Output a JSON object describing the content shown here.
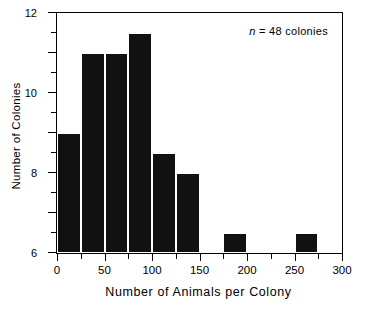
{
  "chart_data": {
    "type": "bar",
    "title": "",
    "subtitle": "",
    "xlabel": "Number of Animals per Colony",
    "ylabel": "Number of Colonies",
    "xlim": [
      0,
      300
    ],
    "ylim": [
      0,
      12
    ],
    "grid": false,
    "legend": null,
    "bin_width": 25,
    "categories": [
      "0-25",
      "25-50",
      "50-75",
      "75-100",
      "100-125",
      "125-150",
      "150-175",
      "175-200",
      "200-225",
      "225-250",
      "250-275",
      "275-300"
    ],
    "bin_starts": [
      0,
      25,
      50,
      75,
      100,
      125,
      150,
      175,
      200,
      225,
      250,
      275
    ],
    "values": [
      6,
      10,
      10,
      11,
      5,
      4,
      0,
      1,
      0,
      0,
      1,
      0
    ],
    "bars": [
      {
        "start": 0,
        "end": 25,
        "value": 6
      },
      {
        "start": 25,
        "end": 50,
        "value": 10
      },
      {
        "start": 50,
        "end": 75,
        "value": 10
      },
      {
        "start": 75,
        "end": 100,
        "value": 11
      },
      {
        "start": 100,
        "end": 125,
        "value": 5
      },
      {
        "start": 125,
        "end": 150,
        "value": 4
      },
      {
        "start": 175,
        "end": 200,
        "value": 1
      },
      {
        "start": 250,
        "end": 275,
        "value": 1
      }
    ],
    "xticks": [
      0,
      25,
      50,
      75,
      100,
      125,
      150,
      175,
      200,
      225,
      250,
      275,
      300
    ],
    "xtick_labels": [
      {
        "value": 0,
        "label": "0"
      },
      {
        "value": 50,
        "label": "50"
      },
      {
        "value": 100,
        "label": "100"
      },
      {
        "value": 150,
        "label": "150"
      },
      {
        "value": 200,
        "label": "200"
      },
      {
        "value": 250,
        "label": "250"
      },
      {
        "value": 300,
        "label": "300"
      }
    ],
    "yticks": [
      0,
      1,
      2,
      3,
      4,
      5,
      6,
      7,
      8,
      9,
      10,
      11,
      12
    ],
    "ytick_labels": [
      {
        "value": 0,
        "label": "0"
      },
      {
        "value": 2,
        "label": "2"
      },
      {
        "value": 4,
        "label": "4"
      },
      {
        "value": 6,
        "label": "6"
      },
      {
        "value": 8,
        "label": "8"
      },
      {
        "value": 10,
        "label": "10"
      },
      {
        "value": 12,
        "label": "12"
      }
    ],
    "annotations": [
      {
        "name": "sample-size",
        "italic_prefix": "n",
        "text": " =  48  colonies"
      }
    ],
    "colors": {
      "bar_fill": "#111111",
      "bar_edge": "#ffffff",
      "axis": "#000000",
      "background": "#ffffff"
    }
  }
}
